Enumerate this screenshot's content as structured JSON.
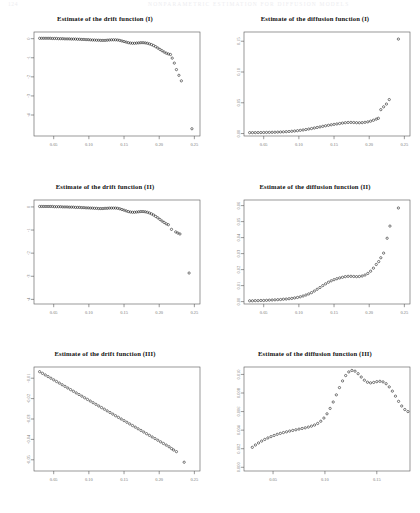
{
  "header": {
    "left": "124",
    "right": "NONPARAMETRIC ESTIMATION FOR DIFFUSION MODELS"
  },
  "panels": [
    {
      "id": "drift-1",
      "title": "Estimate of the drift function (I)"
    },
    {
      "id": "diffusion-1",
      "title": "Estimate of the diffusion function (I)"
    },
    {
      "id": "drift-2",
      "title": "Estimate of the drift function (II)"
    },
    {
      "id": "diffusion-2",
      "title": "Estimate of the diffusion function (II)"
    },
    {
      "id": "drift-3",
      "title": "Estimate of the drift function (III)"
    },
    {
      "id": "diffusion-3",
      "title": "Estimate of the diffusion function (III)"
    }
  ],
  "chart_data": [
    {
      "type": "scatter",
      "id": "drift-1",
      "title": "Estimate of the drift function (I)",
      "xlabel": "",
      "ylabel": "",
      "xlim": [
        0.022,
        0.258
      ],
      "ylim": [
        -5.1,
        0.35
      ],
      "xticks": [
        0.05,
        0.1,
        0.15,
        0.2,
        0.25
      ],
      "xticklabels": [
        "0.05",
        "0.10",
        "0.15",
        "0.20",
        "0.25"
      ],
      "yticks": [
        0,
        -1,
        -2,
        -3,
        -4
      ],
      "yticklabels": [
        "0",
        "-1",
        "-2",
        "-3",
        "-4"
      ],
      "grid": false,
      "legend": null,
      "x": [
        0.03,
        0.033,
        0.036,
        0.039,
        0.042,
        0.045,
        0.048,
        0.051,
        0.054,
        0.057,
        0.06,
        0.063,
        0.066,
        0.069,
        0.072,
        0.075,
        0.078,
        0.081,
        0.084,
        0.087,
        0.09,
        0.093,
        0.096,
        0.099,
        0.102,
        0.105,
        0.108,
        0.111,
        0.114,
        0.117,
        0.12,
        0.123,
        0.126,
        0.129,
        0.132,
        0.135,
        0.138,
        0.141,
        0.144,
        0.147,
        0.15,
        0.153,
        0.156,
        0.159,
        0.162,
        0.165,
        0.168,
        0.171,
        0.174,
        0.177,
        0.18,
        0.183,
        0.186,
        0.189,
        0.192,
        0.195,
        0.198,
        0.201,
        0.204,
        0.207,
        0.21,
        0.213,
        0.216,
        0.2185,
        0.2215,
        0.2245,
        0.228,
        0.2315,
        0.2465
      ],
      "y": [
        0.02,
        0.02,
        0.02,
        0.02,
        0.02,
        0.02,
        0.01,
        0.01,
        0.01,
        0.0,
        0.0,
        0.0,
        -0.01,
        -0.01,
        -0.01,
        -0.02,
        -0.02,
        -0.02,
        -0.03,
        -0.03,
        -0.04,
        -0.04,
        -0.05,
        -0.05,
        -0.06,
        -0.07,
        -0.07,
        -0.08,
        -0.08,
        -0.09,
        -0.09,
        -0.09,
        -0.08,
        -0.07,
        -0.06,
        -0.06,
        -0.06,
        -0.07,
        -0.09,
        -0.12,
        -0.15,
        -0.18,
        -0.21,
        -0.23,
        -0.24,
        -0.24,
        -0.23,
        -0.22,
        -0.21,
        -0.21,
        -0.22,
        -0.24,
        -0.27,
        -0.31,
        -0.36,
        -0.42,
        -0.49,
        -0.56,
        -0.63,
        -0.7,
        -0.76,
        -0.8,
        -0.83,
        -1.02,
        -1.28,
        -1.62,
        -1.92,
        -2.21,
        -4.72
      ]
    },
    {
      "type": "scatter",
      "id": "diffusion-1",
      "title": "Estimate of the diffusion function (I)",
      "xlabel": "",
      "ylabel": "",
      "xlim": [
        0.022,
        0.258
      ],
      "ylim": [
        -0.004,
        0.165
      ],
      "xticks": [
        0.05,
        0.1,
        0.15,
        0.2,
        0.25
      ],
      "xticklabels": [
        "0.05",
        "0.10",
        "0.15",
        "0.20",
        "0.25"
      ],
      "yticks": [
        0.0,
        0.05,
        0.1,
        0.15
      ],
      "yticklabels": [
        "0.00",
        "0.05",
        "0.10",
        "0.15"
      ],
      "grid": false,
      "legend": null,
      "x": [
        0.03,
        0.034,
        0.038,
        0.042,
        0.046,
        0.05,
        0.054,
        0.058,
        0.062,
        0.066,
        0.07,
        0.074,
        0.078,
        0.082,
        0.086,
        0.09,
        0.094,
        0.098,
        0.102,
        0.106,
        0.11,
        0.114,
        0.118,
        0.122,
        0.126,
        0.13,
        0.134,
        0.138,
        0.142,
        0.146,
        0.15,
        0.154,
        0.158,
        0.162,
        0.166,
        0.17,
        0.174,
        0.178,
        0.182,
        0.186,
        0.19,
        0.194,
        0.198,
        0.202,
        0.206,
        0.21,
        0.213,
        0.2165,
        0.2205,
        0.2245,
        0.2285,
        0.2415
      ],
      "y": [
        0.0015,
        0.0015,
        0.0015,
        0.0016,
        0.0016,
        0.0017,
        0.0018,
        0.0019,
        0.002,
        0.0021,
        0.0023,
        0.0025,
        0.0027,
        0.003,
        0.0033,
        0.0037,
        0.0041,
        0.0046,
        0.0052,
        0.0058,
        0.0065,
        0.0073,
        0.0081,
        0.009,
        0.0099,
        0.0108,
        0.0117,
        0.0126,
        0.0134,
        0.0142,
        0.0149,
        0.0156,
        0.0163,
        0.017,
        0.0176,
        0.018,
        0.0181,
        0.0179,
        0.0176,
        0.0175,
        0.0177,
        0.0182,
        0.019,
        0.0201,
        0.0216,
        0.0234,
        0.0248,
        0.0388,
        0.0434,
        0.0479,
        0.0552,
        0.1535
      ]
    },
    {
      "type": "scatter",
      "id": "drift-2",
      "title": "Estimate of the drift function (II)",
      "xlabel": "",
      "ylabel": "",
      "xlim": [
        0.022,
        0.258
      ],
      "ylim": [
        -4.2,
        0.3
      ],
      "xticks": [
        0.05,
        0.1,
        0.15,
        0.2,
        0.25
      ],
      "xticklabels": [
        "0.05",
        "0.10",
        "0.15",
        "0.20",
        "0.25"
      ],
      "yticks": [
        0,
        -1,
        -2,
        -3,
        -4
      ],
      "yticklabels": [
        "0",
        "-1",
        "-2",
        "-3",
        "-4"
      ],
      "grid": false,
      "legend": null,
      "x": [
        0.03,
        0.033,
        0.036,
        0.039,
        0.042,
        0.045,
        0.048,
        0.051,
        0.054,
        0.057,
        0.06,
        0.063,
        0.066,
        0.069,
        0.072,
        0.075,
        0.078,
        0.081,
        0.084,
        0.087,
        0.09,
        0.093,
        0.096,
        0.099,
        0.102,
        0.105,
        0.108,
        0.111,
        0.114,
        0.117,
        0.12,
        0.123,
        0.126,
        0.129,
        0.132,
        0.135,
        0.138,
        0.141,
        0.144,
        0.147,
        0.15,
        0.153,
        0.156,
        0.159,
        0.162,
        0.165,
        0.168,
        0.171,
        0.174,
        0.177,
        0.18,
        0.183,
        0.186,
        0.189,
        0.192,
        0.195,
        0.198,
        0.201,
        0.204,
        0.207,
        0.21,
        0.213,
        0.2175,
        0.2235,
        0.2265,
        0.2295,
        0.2425
      ],
      "y": [
        0.02,
        0.02,
        0.02,
        0.02,
        0.02,
        0.02,
        0.02,
        0.01,
        0.01,
        0.01,
        0.01,
        0.0,
        0.0,
        0.0,
        -0.01,
        -0.01,
        -0.01,
        -0.02,
        -0.02,
        -0.02,
        -0.03,
        -0.03,
        -0.04,
        -0.04,
        -0.05,
        -0.05,
        -0.06,
        -0.06,
        -0.07,
        -0.07,
        -0.07,
        -0.06,
        -0.06,
        -0.05,
        -0.05,
        -0.05,
        -0.05,
        -0.06,
        -0.08,
        -0.11,
        -0.14,
        -0.17,
        -0.2,
        -0.22,
        -0.23,
        -0.23,
        -0.22,
        -0.21,
        -0.2,
        -0.2,
        -0.21,
        -0.23,
        -0.26,
        -0.3,
        -0.35,
        -0.41,
        -0.47,
        -0.54,
        -0.61,
        -0.67,
        -0.73,
        -0.77,
        -0.97,
        -1.08,
        -1.13,
        -1.17,
        -2.86
      ]
    },
    {
      "type": "scatter",
      "id": "diffusion-2",
      "title": "Estimate of the diffusion function (II)",
      "xlabel": "",
      "ylabel": "",
      "xlim": [
        0.022,
        0.258
      ],
      "ylim": [
        -0.0015,
        0.0635
      ],
      "xticks": [
        0.05,
        0.1,
        0.15,
        0.2,
        0.25
      ],
      "xticklabels": [
        "0.05",
        "0.10",
        "0.15",
        "0.20",
        "0.25"
      ],
      "yticks": [
        0.0,
        0.01,
        0.02,
        0.03,
        0.04,
        0.05,
        0.06
      ],
      "yticklabels": [
        "0.00",
        "0.01",
        "0.02",
        "0.03",
        "0.04",
        "0.05",
        "0.06"
      ],
      "grid": false,
      "legend": null,
      "x": [
        0.03,
        0.034,
        0.038,
        0.042,
        0.046,
        0.05,
        0.054,
        0.058,
        0.062,
        0.066,
        0.07,
        0.074,
        0.078,
        0.082,
        0.086,
        0.09,
        0.094,
        0.098,
        0.102,
        0.106,
        0.11,
        0.114,
        0.118,
        0.122,
        0.126,
        0.13,
        0.134,
        0.138,
        0.142,
        0.146,
        0.15,
        0.154,
        0.158,
        0.162,
        0.166,
        0.17,
        0.174,
        0.178,
        0.182,
        0.186,
        0.19,
        0.194,
        0.198,
        0.202,
        0.206,
        0.21,
        0.2135,
        0.2165,
        0.2205,
        0.2255,
        0.2295,
        0.2415
      ],
      "y": [
        0.0005,
        0.0005,
        0.0006,
        0.0006,
        0.0007,
        0.0007,
        0.0008,
        0.0009,
        0.001,
        0.0011,
        0.0012,
        0.0013,
        0.0015,
        0.0016,
        0.0018,
        0.002,
        0.0023,
        0.0026,
        0.003,
        0.0035,
        0.0041,
        0.0048,
        0.0056,
        0.0066,
        0.0077,
        0.0088,
        0.01,
        0.0111,
        0.0121,
        0.013,
        0.0137,
        0.0143,
        0.0148,
        0.0152,
        0.0156,
        0.0158,
        0.0158,
        0.0157,
        0.0156,
        0.0157,
        0.016,
        0.0166,
        0.0176,
        0.019,
        0.0209,
        0.0232,
        0.025,
        0.0274,
        0.0303,
        0.0396,
        0.0472,
        0.0585
      ]
    },
    {
      "type": "scatter",
      "id": "drift-3",
      "title": "Estimate of the drift function (III)",
      "xlabel": "",
      "ylabel": "",
      "xlim": [
        0.022,
        0.258
      ],
      "ylim": [
        -0.0555,
        -0.0045
      ],
      "xticks": [
        0.05,
        0.1,
        0.15,
        0.2,
        0.25
      ],
      "xticklabels": [
        "0.05",
        "0.10",
        "0.15",
        "0.20",
        "0.25"
      ],
      "yticks": [
        -0.01,
        -0.02,
        -0.03,
        -0.04,
        -0.05
      ],
      "yticklabels": [
        "-0.01",
        "-0.02",
        "-0.03",
        "-0.04",
        "-0.05"
      ],
      "grid": false,
      "legend": null,
      "x": [
        0.03,
        0.034,
        0.038,
        0.042,
        0.046,
        0.05,
        0.054,
        0.058,
        0.062,
        0.066,
        0.07,
        0.074,
        0.078,
        0.082,
        0.086,
        0.09,
        0.094,
        0.098,
        0.102,
        0.106,
        0.11,
        0.114,
        0.118,
        0.122,
        0.126,
        0.13,
        0.134,
        0.138,
        0.142,
        0.146,
        0.15,
        0.154,
        0.158,
        0.162,
        0.166,
        0.17,
        0.174,
        0.178,
        0.182,
        0.186,
        0.19,
        0.194,
        0.198,
        0.202,
        0.206,
        0.21,
        0.214,
        0.2175,
        0.2205,
        0.2245,
        0.2355
      ],
      "y": [
        -0.0068,
        -0.0076,
        -0.0084,
        -0.0092,
        -0.01,
        -0.0108,
        -0.0116,
        -0.0124,
        -0.0132,
        -0.014,
        -0.0148,
        -0.0156,
        -0.0164,
        -0.0172,
        -0.018,
        -0.0188,
        -0.0196,
        -0.0204,
        -0.0212,
        -0.022,
        -0.0228,
        -0.0236,
        -0.0244,
        -0.0252,
        -0.026,
        -0.0268,
        -0.0276,
        -0.0284,
        -0.0292,
        -0.03,
        -0.0308,
        -0.0316,
        -0.0324,
        -0.0332,
        -0.034,
        -0.0348,
        -0.0356,
        -0.0364,
        -0.0372,
        -0.038,
        -0.0388,
        -0.0396,
        -0.0404,
        -0.0412,
        -0.042,
        -0.0428,
        -0.0436,
        -0.0445,
        -0.0452,
        -0.046,
        -0.0512
      ]
    },
    {
      "type": "scatter",
      "id": "diffusion-3",
      "title": "Estimate of the diffusion function (III)",
      "xlabel": "",
      "ylabel": "",
      "xlim": [
        0.022,
        0.182
      ],
      "ylim": [
        -0.0004,
        0.0108
      ],
      "xticks": [
        0.05,
        0.1,
        0.15
      ],
      "xticklabels": [
        "0.05",
        "0.10",
        "0.15"
      ],
      "yticks": [
        0.0,
        0.002,
        0.004,
        0.006,
        0.008,
        0.01
      ],
      "yticklabels": [
        "0.000",
        "0.002",
        "0.004",
        "0.006",
        "0.008",
        "0.010"
      ],
      "grid": false,
      "legend": null,
      "x": [
        0.03,
        0.033,
        0.036,
        0.039,
        0.042,
        0.045,
        0.048,
        0.051,
        0.054,
        0.057,
        0.06,
        0.063,
        0.066,
        0.069,
        0.072,
        0.075,
        0.078,
        0.081,
        0.084,
        0.087,
        0.09,
        0.093,
        0.096,
        0.099,
        0.102,
        0.105,
        0.108,
        0.111,
        0.114,
        0.117,
        0.12,
        0.123,
        0.126,
        0.129,
        0.132,
        0.135,
        0.138,
        0.141,
        0.144,
        0.147,
        0.15,
        0.153,
        0.156,
        0.159,
        0.162,
        0.165,
        0.168,
        0.171,
        0.174,
        0.177,
        0.18
      ],
      "y": [
        0.00215,
        0.0024,
        0.00262,
        0.00282,
        0.003,
        0.00316,
        0.0033,
        0.00343,
        0.00355,
        0.00365,
        0.00374,
        0.00382,
        0.0039,
        0.00397,
        0.00404,
        0.00411,
        0.00418,
        0.00425,
        0.00433,
        0.00443,
        0.00455,
        0.00472,
        0.00496,
        0.0053,
        0.00576,
        0.00634,
        0.00703,
        0.0078,
        0.00858,
        0.0093,
        0.00988,
        0.01027,
        0.01043,
        0.01035,
        0.01008,
        0.00972,
        0.00938,
        0.00916,
        0.00909,
        0.00914,
        0.00922,
        0.00926,
        0.0092,
        0.009,
        0.00866,
        0.0082,
        0.00766,
        0.0071,
        0.0066,
        0.00622,
        0.006
      ]
    }
  ]
}
